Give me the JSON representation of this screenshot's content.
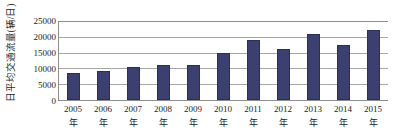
{
  "chart_data": {
    "type": "bar",
    "title": "",
    "subtitle": "",
    "xlabel": "",
    "ylabel": "日平均交通流量(辆/日)",
    "categories": [
      "2005年",
      "2006年",
      "2007年",
      "2008年",
      "2009年",
      "2010年",
      "2011年",
      "2012年",
      "2013年",
      "2014年",
      "2015年"
    ],
    "category_year": [
      "2005",
      "2006",
      "2007",
      "2008",
      "2009",
      "2010",
      "2011",
      "2012",
      "2013",
      "2014",
      "2015"
    ],
    "category_unit": [
      "年",
      "年",
      "年",
      "年",
      "年",
      "年",
      "年",
      "年",
      "年",
      "年",
      "年"
    ],
    "values": [
      8700,
      9200,
      10300,
      11100,
      11200,
      14800,
      19000,
      16000,
      21000,
      17500,
      22000
    ],
    "series": [
      {
        "name": "日平均交通流量",
        "values": [
          8700,
          9200,
          10300,
          11100,
          11200,
          14800,
          19000,
          16000,
          21000,
          17500,
          22000
        ]
      }
    ],
    "ylim": [
      0,
      25000
    ],
    "yticks": [
      0,
      5000,
      10000,
      15000,
      20000,
      25000
    ],
    "ytick_labels": [
      "0",
      "5000",
      "10000",
      "15000",
      "20000",
      "25000"
    ],
    "grid": true,
    "grid_axis": "y",
    "legend": false,
    "legend_position": "none",
    "bar_color": "#3c4070",
    "bar_edge_color": "#2b2f55",
    "grid_color": "#a6a6a6",
    "axis_color": "#8e8e8e",
    "background_color": "#ffffff"
  }
}
